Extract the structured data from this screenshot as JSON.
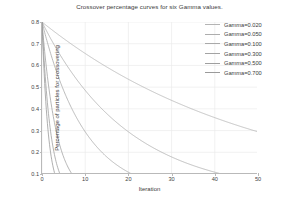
{
  "chart_data": {
    "type": "line",
    "title": "Crossover percentage curves for six Gamma values.",
    "xlabel": "Iteration",
    "ylabel": "Percentage of particles for crossovering",
    "xlim": [
      0,
      50
    ],
    "ylim": [
      0.1,
      0.8
    ],
    "xticks": [
      0,
      10,
      20,
      30,
      40,
      50
    ],
    "yticks": [
      0.1,
      0.2,
      0.3,
      0.4,
      0.5,
      0.6,
      0.7,
      0.8
    ],
    "xtick_labels": [
      "0",
      "10",
      "20",
      "30",
      "40",
      "50"
    ],
    "ytick_labels": [
      "0.1",
      "0.2",
      "0.3",
      "0.4",
      "0.5",
      "0.6",
      "0.7",
      "0.8"
    ],
    "grid": true,
    "legend_position": "upper right",
    "start_value": 0.8,
    "floor_value": 0.1,
    "model": "y = max(0.1, 0.8 * exp(-gamma * x))",
    "series": [
      {
        "name": "Gamma=0.020",
        "gamma": 0.02,
        "color": "#b4b4b4",
        "x": [
          0,
          5,
          10,
          15,
          20,
          25,
          30,
          35,
          40,
          45,
          49
        ],
        "values": [
          0.8,
          0.724,
          0.655,
          0.593,
          0.536,
          0.485,
          0.439,
          0.397,
          0.36,
          0.326,
          0.301
        ]
      },
      {
        "name": "Gamma=0.050",
        "gamma": 0.05,
        "color": "#adadad",
        "x": [
          0,
          5,
          10,
          15,
          20,
          25,
          30,
          35,
          40,
          41.6,
          50
        ],
        "values": [
          0.8,
          0.623,
          0.485,
          0.378,
          0.294,
          0.229,
          0.179,
          0.139,
          0.108,
          0.1,
          0.1
        ]
      },
      {
        "name": "Gamma=0.100",
        "gamma": 0.1,
        "color": "#a9a9a9",
        "x": [
          0,
          2,
          4,
          6,
          8,
          10,
          12,
          14,
          16,
          18,
          20.8,
          30,
          50
        ],
        "values": [
          0.8,
          0.655,
          0.536,
          0.439,
          0.359,
          0.294,
          0.241,
          0.197,
          0.162,
          0.132,
          0.1,
          0.1,
          0.1
        ]
      },
      {
        "name": "Gamma=0.300",
        "gamma": 0.3,
        "color": "#a3a3a3",
        "x": [
          0,
          1,
          2,
          3,
          4,
          5,
          6,
          6.93,
          10,
          20,
          50
        ],
        "values": [
          0.8,
          0.593,
          0.439,
          0.325,
          0.241,
          0.179,
          0.132,
          0.1,
          0.1,
          0.1,
          0.1
        ]
      },
      {
        "name": "Gamma=0.500",
        "gamma": 0.5,
        "color": "#9f9f9f",
        "x": [
          0,
          0.5,
          1,
          1.5,
          2,
          2.5,
          3,
          3.5,
          4.16,
          10,
          50
        ],
        "values": [
          0.8,
          0.623,
          0.485,
          0.378,
          0.294,
          0.229,
          0.179,
          0.139,
          0.1,
          0.1,
          0.1
        ]
      },
      {
        "name": "Gamma=0.700",
        "gamma": 0.7,
        "color": "#9a9a9a",
        "x": [
          0,
          0.5,
          1,
          1.5,
          2,
          2.5,
          2.97,
          6,
          20,
          50
        ],
        "values": [
          0.8,
          0.564,
          0.397,
          0.28,
          0.197,
          0.139,
          0.1,
          0.1,
          0.1,
          0.1
        ]
      }
    ]
  },
  "legend": {
    "items": [
      {
        "label": "Gamma=0.020"
      },
      {
        "label": "Gamma=0.050"
      },
      {
        "label": "Gamma=0.100"
      },
      {
        "label": "Gamma=0.300"
      },
      {
        "label": "Gamma=0.500"
      },
      {
        "label": "Gamma=0.700"
      }
    ]
  }
}
